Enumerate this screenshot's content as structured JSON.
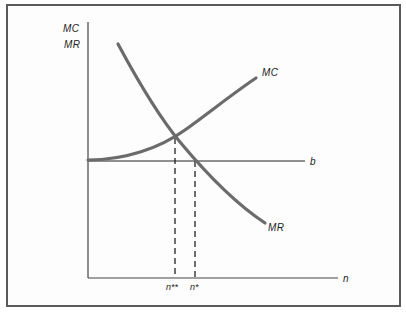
{
  "diagram": {
    "y_axis_label_line1": "MC",
    "y_axis_label_line2": "MR",
    "x_axis_label": "n",
    "curves": [
      {
        "name": "MC",
        "label": "MC",
        "shape": "increasing convex",
        "color": "#6b6b6b"
      },
      {
        "name": "MR",
        "label": "MR",
        "shape": "decreasing convex",
        "color": "#6b6b6b"
      }
    ],
    "horizontal_line": {
      "label": "b",
      "color": "#6b6b6b"
    },
    "markers": [
      {
        "label": "n**",
        "description": "quantity where MC = MR"
      },
      {
        "label": "n*",
        "description": "quantity where MR = b"
      }
    ],
    "colors": {
      "frame": "#5a5a5a",
      "curve": "#6b6b6b",
      "axis": "#444444",
      "text": "#222222"
    }
  }
}
